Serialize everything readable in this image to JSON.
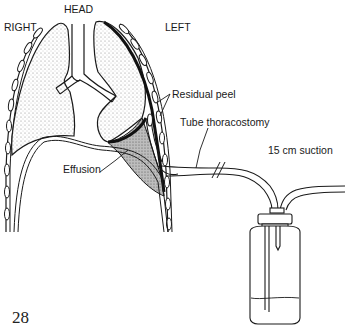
{
  "diagram": {
    "orientation_labels": {
      "right": "RIGHT",
      "head": "HEAD",
      "left": "LEFT"
    },
    "annotations": {
      "residual_peel": "Residual peel",
      "tube_thoracostomy": "Tube thoracostomy",
      "effusion": "Effusion",
      "suction": "15 cm suction"
    },
    "figure_number": "28",
    "colors": {
      "ink": "#1a1a1a",
      "lung_stipple": "#cfcfcf",
      "background": "#ffffff"
    }
  }
}
